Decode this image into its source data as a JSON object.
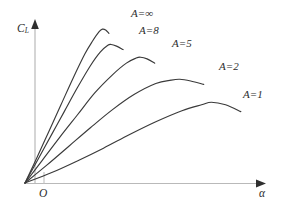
{
  "figure": {
    "background_color": "#ffffff",
    "curve_color": "#3a3a3a",
    "axis_color": "#b9b9b9",
    "text_color": "#2d2d2d",
    "axis_label_y": "C",
    "axis_label_y_sub": "L",
    "axis_label_x": "α",
    "origin_label": "O"
  },
  "chart_data": {
    "type": "line",
    "title": "",
    "subtitle": "",
    "xlabel": "α",
    "ylabel": "C_L",
    "grid": false,
    "legend_position": "inline-curve-end",
    "axis_arrows": true,
    "xlim": [
      0,
      10
    ],
    "ylim": [
      0,
      10
    ],
    "xticks": [],
    "yticks": [],
    "annotations": [
      "O"
    ],
    "series": [
      {
        "name": "A=∞",
        "label": "A=∞",
        "aspect_ratio": "∞",
        "slope_rank": 1,
        "peak": {
          "x": 3.55,
          "y": 9.05
        },
        "x": [
          0.0,
          0.55,
          1.1,
          1.65,
          2.2,
          2.75,
          3.1,
          3.4,
          3.55,
          3.7,
          3.85
        ],
        "y": [
          0.0,
          1.5,
          3.05,
          4.6,
          6.15,
          7.6,
          8.35,
          8.9,
          9.05,
          9.0,
          8.8
        ]
      },
      {
        "name": "A=8",
        "label": "A=8",
        "aspect_ratio": "8",
        "slope_rank": 2,
        "peak": {
          "x": 3.95,
          "y": 8.15
        },
        "x": [
          0.0,
          0.6,
          1.2,
          1.8,
          2.4,
          3.0,
          3.45,
          3.8,
          3.95,
          4.2,
          4.5
        ],
        "y": [
          0.0,
          1.4,
          2.8,
          4.2,
          5.6,
          6.9,
          7.7,
          8.1,
          8.15,
          8.05,
          7.85
        ]
      },
      {
        "name": "A=5",
        "label": "A=5",
        "aspect_ratio": "5",
        "slope_rank": 3,
        "peak": {
          "x": 5.3,
          "y": 7.4
        },
        "x": [
          0.0,
          0.8,
          1.6,
          2.4,
          3.2,
          4.0,
          4.65,
          5.1,
          5.3,
          5.6,
          5.95
        ],
        "y": [
          0.0,
          1.35,
          2.7,
          4.0,
          5.3,
          6.35,
          7.05,
          7.35,
          7.4,
          7.3,
          7.05
        ]
      },
      {
        "name": "A=2",
        "label": "A=2",
        "aspect_ratio": "2",
        "slope_rank": 4,
        "peak": {
          "x": 7.1,
          "y": 6.1
        },
        "x": [
          0.0,
          1.0,
          2.0,
          3.0,
          4.0,
          5.0,
          6.0,
          6.7,
          7.1,
          7.6,
          8.2
        ],
        "y": [
          0.0,
          1.05,
          2.15,
          3.25,
          4.3,
          5.2,
          5.85,
          6.05,
          6.1,
          6.0,
          5.8
        ]
      },
      {
        "name": "A=1",
        "label": "A=1",
        "aspect_ratio": "1",
        "slope_rank": 5,
        "peak": {
          "x": 8.55,
          "y": 4.75
        },
        "x": [
          0.0,
          1.2,
          2.4,
          3.6,
          4.8,
          6.0,
          7.2,
          8.1,
          8.55,
          9.2,
          9.9
        ],
        "y": [
          0.0,
          0.6,
          1.3,
          2.05,
          2.85,
          3.6,
          4.25,
          4.6,
          4.75,
          4.6,
          4.2
        ]
      }
    ]
  }
}
